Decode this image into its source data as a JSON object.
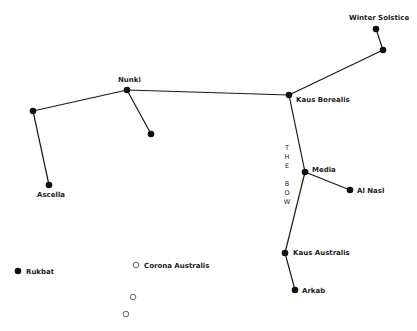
{
  "diagram": {
    "colors": {
      "line": "#1a1a1a",
      "star_fill": "#111111",
      "background": "#ffffff"
    },
    "stars": [
      {
        "id": "winter-solstice",
        "label": "Winter Solstice",
        "x": 376,
        "y": 29,
        "filled": true,
        "lx": 349,
        "ly": 20
      },
      {
        "id": "bow-tip",
        "label": "",
        "x": 383,
        "y": 50,
        "filled": true
      },
      {
        "id": "kaus-borealis",
        "label": "Kaus Borealis",
        "x": 289,
        "y": 95,
        "filled": true,
        "lx": 296,
        "ly": 102
      },
      {
        "id": "nunki",
        "label": "Nunki",
        "x": 127,
        "y": 90,
        "filled": true,
        "lx": 118,
        "ly": 82
      },
      {
        "id": "west-star",
        "label": "",
        "x": 33,
        "y": 111,
        "filled": true
      },
      {
        "id": "nunki-branch",
        "label": "",
        "x": 151,
        "y": 134,
        "filled": true
      },
      {
        "id": "ascella",
        "label": "Ascella",
        "x": 49,
        "y": 185,
        "filled": true,
        "lx": 37,
        "ly": 197
      },
      {
        "id": "media",
        "label": "Media",
        "x": 305,
        "y": 172,
        "filled": true,
        "lx": 312,
        "ly": 172
      },
      {
        "id": "al-nasl",
        "label": "Al Nasl",
        "x": 350,
        "y": 190,
        "filled": true,
        "lx": 357,
        "ly": 193
      },
      {
        "id": "kaus-australis",
        "label": "Kaus Australis",
        "x": 285,
        "y": 253,
        "filled": true,
        "lx": 293,
        "ly": 255
      },
      {
        "id": "arkab",
        "label": "Arkab",
        "x": 295,
        "y": 290,
        "filled": true,
        "lx": 302,
        "ly": 293
      },
      {
        "id": "rukbat",
        "label": "Rukbat",
        "x": 18,
        "y": 271,
        "filled": true,
        "lx": 26,
        "ly": 274
      },
      {
        "id": "corona-australis-1",
        "label": "Corona Australis",
        "x": 136,
        "y": 265,
        "filled": false,
        "lx": 144,
        "ly": 268
      },
      {
        "id": "corona-australis-2",
        "label": "",
        "x": 133,
        "y": 297,
        "filled": false
      },
      {
        "id": "corona-australis-3",
        "label": "",
        "x": 126,
        "y": 314,
        "filled": false
      }
    ],
    "lines": [
      [
        "winter-solstice",
        "bow-tip"
      ],
      [
        "bow-tip",
        "kaus-borealis"
      ],
      [
        "kaus-borealis",
        "nunki"
      ],
      [
        "nunki",
        "west-star"
      ],
      [
        "nunki",
        "nunki-branch"
      ],
      [
        "west-star",
        "ascella"
      ],
      [
        "kaus-borealis",
        "media"
      ],
      [
        "media",
        "al-nasl"
      ],
      [
        "media",
        "kaus-australis"
      ],
      [
        "kaus-australis",
        "arkab"
      ]
    ],
    "bow_label": {
      "letters": [
        "T",
        "H",
        "E",
        "",
        "B",
        "O",
        "W"
      ],
      "x": 287,
      "y": 150
    }
  }
}
